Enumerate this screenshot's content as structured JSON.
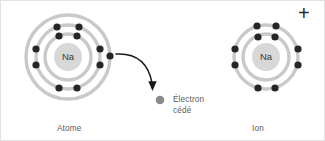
{
  "figure": {
    "background_color": "#ffffff",
    "border_color": "#e3e3e3"
  },
  "colors": {
    "shell": "#c9c9c9",
    "electron": "#262626",
    "free_electron": "#8a8a8a",
    "nucleus_fill": "#d8d8d8",
    "nucleus_text": "#3a3a3a",
    "label_text": "#5a5a5a",
    "arrow": "#1a1a1a",
    "plus": "#2b2b2b"
  },
  "labels": {
    "atome": "Atome",
    "ion": "Ion",
    "electron_cede_line1": "Électron",
    "electron_cede_line2": "cédé",
    "plus_charge": "+"
  },
  "atom": {
    "name": "Atome",
    "nucleus_symbol": "Na",
    "center": {
      "x": 67,
      "y": 56
    },
    "nucleus_radius": 14,
    "shells": [
      {
        "index": 1,
        "radius": 23,
        "electron_count": 2
      },
      {
        "index": 2,
        "radius": 32,
        "electron_count": 8
      },
      {
        "index": 3,
        "radius": 42,
        "electron_count": 1
      }
    ],
    "total_electrons": 11,
    "electron_configuration": "2-8-1",
    "charge": "0",
    "electrons": [
      {
        "shell": 1,
        "x": 58,
        "y": 35
      },
      {
        "shell": 1,
        "x": 76,
        "y": 35
      },
      {
        "shell": 2,
        "x": 56,
        "y": 26
      },
      {
        "shell": 2,
        "x": 78,
        "y": 26
      },
      {
        "shell": 2,
        "x": 35,
        "y": 48
      },
      {
        "shell": 2,
        "x": 35,
        "y": 64
      },
      {
        "shell": 2,
        "x": 99,
        "y": 48
      },
      {
        "shell": 2,
        "x": 99,
        "y": 64
      },
      {
        "shell": 2,
        "x": 58,
        "y": 87
      },
      {
        "shell": 2,
        "x": 76,
        "y": 87
      },
      {
        "shell": 3,
        "x": 109,
        "y": 55
      }
    ]
  },
  "ion": {
    "name": "Ion",
    "nucleus_symbol": "Na",
    "center": {
      "x": 265,
      "y": 56
    },
    "nucleus_radius": 14,
    "shells": [
      {
        "index": 1,
        "radius": 23,
        "electron_count": 2
      },
      {
        "index": 2,
        "radius": 32,
        "electron_count": 8
      }
    ],
    "total_electrons": 10,
    "electron_configuration": "2-8",
    "charge": "+",
    "electrons": [
      {
        "shell": 1,
        "x": 257,
        "y": 36
      },
      {
        "shell": 1,
        "x": 274,
        "y": 36
      },
      {
        "shell": 2,
        "x": 256,
        "y": 25
      },
      {
        "shell": 2,
        "x": 275,
        "y": 25
      },
      {
        "shell": 2,
        "x": 234,
        "y": 48
      },
      {
        "shell": 2,
        "x": 234,
        "y": 64
      },
      {
        "shell": 2,
        "x": 297,
        "y": 48
      },
      {
        "shell": 2,
        "x": 297,
        "y": 64
      },
      {
        "shell": 2,
        "x": 257,
        "y": 87
      },
      {
        "shell": 2,
        "x": 274,
        "y": 87
      }
    ]
  },
  "transfer": {
    "arrow_description": "curved arrow from atom outer electron to released electron",
    "arrow_start": {
      "x": 116,
      "y": 54
    },
    "arrow_end": {
      "x": 152,
      "y": 86
    },
    "free_electron": {
      "x": 158,
      "y": 99,
      "radius": 4.2
    }
  }
}
